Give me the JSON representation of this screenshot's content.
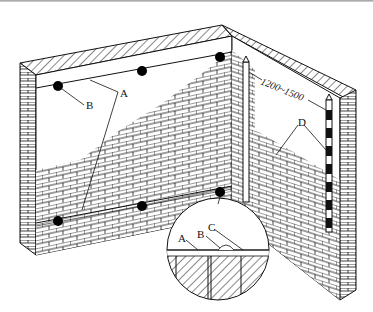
{
  "diagram": {
    "title": "",
    "labels": {
      "a": "A",
      "b": "B",
      "c": "C",
      "d": "D",
      "detail_a": "A",
      "detail_b": "B",
      "detail_c": "C",
      "dimension": "1200~1500"
    },
    "components": {
      "left_wall": "brick wall (left face, partially plastered)",
      "right_wall": "brick wall (right face)",
      "corner_rods": "vertical reference rods at wall corner",
      "marker_dots": "plaster thickness markers along guide lines",
      "striped_rod": "black/white striped guide bar",
      "detail_circle": "magnified section detail"
    },
    "colors": {
      "line": "#111111",
      "fill": "#ffffff",
      "dot": "#000000"
    }
  }
}
